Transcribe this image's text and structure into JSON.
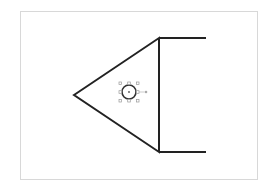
{
  "diagram": {
    "frame": {
      "x": 20,
      "y": 11,
      "width": 237,
      "height": 168,
      "stroke": "#d8d8d8"
    },
    "shape": {
      "stroke": "#222222",
      "triangle": {
        "left": [
          74,
          95
        ],
        "top": [
          159,
          38
        ],
        "bottom": [
          159,
          152
        ]
      },
      "top_line": {
        "from": [
          159,
          38
        ],
        "to": [
          206,
          38
        ]
      },
      "bottom_line": {
        "from": [
          159,
          152
        ],
        "to": [
          206,
          152
        ]
      }
    },
    "selected_circle": {
      "cx": 129,
      "cy": 92,
      "r": 7,
      "stroke": "#333333",
      "handle_color": "#999999",
      "bbox": {
        "x": 120,
        "y": 83,
        "size": 18
      },
      "rotate_handle": [
        146,
        92
      ]
    }
  }
}
